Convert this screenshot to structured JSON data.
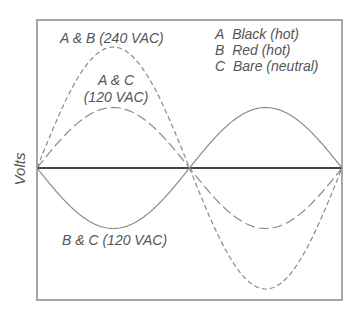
{
  "diagram": {
    "title": "",
    "y_axis_label": "Volts",
    "curve_labels": {
      "ab": "A & B (240 VAC)",
      "ac_line1": "A & C",
      "ac_line2": "(120 VAC)",
      "bc": "B & C (120 VAC)"
    },
    "legend": [
      {
        "key": "A",
        "text": "Black (hot)"
      },
      {
        "key": "B",
        "text": "Red (hot)"
      },
      {
        "key": "C",
        "text": "Bare (neutral)"
      }
    ],
    "colors": {
      "frame": "#888888",
      "axis": "#444444",
      "curves": "#888888",
      "text": "#555555"
    }
  },
  "chart_data": {
    "type": "line",
    "title": "",
    "xlabel": "",
    "ylabel": "Volts",
    "series": [
      {
        "name": "A & B (240 VAC)",
        "style": "dashed-short",
        "amplitude_rel": 2,
        "phase_deg": 0
      },
      {
        "name": "A & C (120 VAC)",
        "style": "dashed-long",
        "amplitude_rel": 1,
        "phase_deg": 0
      },
      {
        "name": "B & C (120 VAC)",
        "style": "solid",
        "amplitude_rel": 1,
        "phase_deg": 180
      }
    ],
    "x_cycles": 1,
    "grid": false,
    "legend_position": "top-right"
  }
}
